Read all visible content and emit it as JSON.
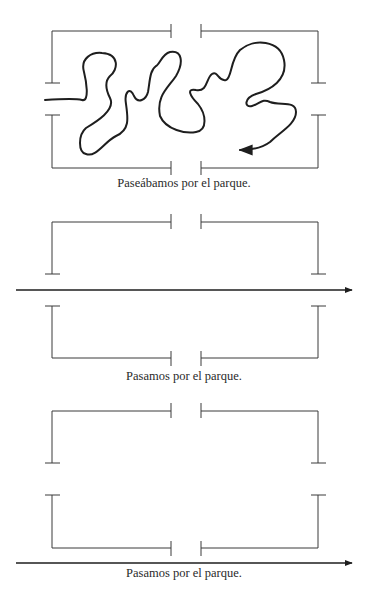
{
  "figures": [
    {
      "id": "meandering",
      "caption": "Paseábamos por el parque.",
      "path_type": "meandering-curve-with-arrow"
    },
    {
      "id": "straight-through-middle",
      "caption": "Pasamos por el parque.",
      "path_type": "straight-arrow-through-side-openings"
    },
    {
      "id": "straight-past-bottom",
      "caption": "Pasamos por el parque.",
      "path_type": "straight-arrow-below-park"
    }
  ],
  "colors": {
    "line": "#1e1e1e",
    "frame": "#3a3a3a",
    "background": "#ffffff"
  }
}
